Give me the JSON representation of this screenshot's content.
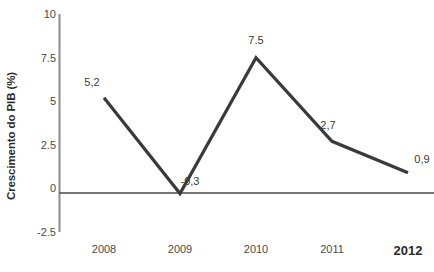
{
  "chart_data": {
    "type": "line",
    "title": "",
    "xlabel": "",
    "ylabel": "Crescimento do PIB (%)",
    "categories": [
      "2008",
      "2009",
      "2010",
      "2011",
      "2012"
    ],
    "values": [
      5.2,
      -0.3,
      7.5,
      2.7,
      0.9
    ],
    "point_labels": [
      "5,2",
      "-0,3",
      "7.5",
      "2,7",
      "0,9"
    ],
    "ylim": [
      -2.5,
      10
    ],
    "y_ticks": [
      10,
      7.5,
      5,
      2.5,
      0,
      -2.5
    ],
    "y_tick_labels": [
      "10",
      "7.5",
      "5",
      "2.5",
      "0",
      "-2.5"
    ],
    "grid": false,
    "legend": "none",
    "zero_line": true,
    "series_color": "#3a3a3a",
    "axis_color": "#8a8a8a",
    "emphasis_category": "2012"
  }
}
